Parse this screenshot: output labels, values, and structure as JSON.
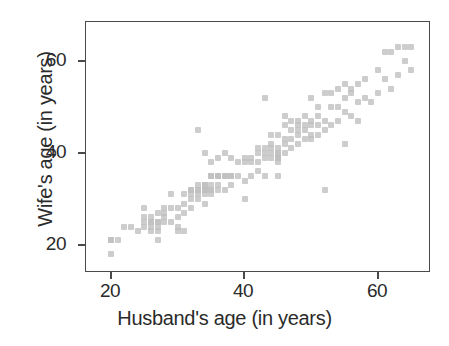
{
  "chart_data": {
    "type": "scatter",
    "title": "",
    "xlabel": "Husband's age (in years)",
    "ylabel": "Wife's age (in years)",
    "xlim": [
      17,
      68
    ],
    "ylim": [
      15,
      66
    ],
    "xticks": [
      20,
      40,
      60
    ],
    "yticks": [
      20,
      40,
      60
    ],
    "xtick_labels": [
      "20",
      "40",
      "60"
    ],
    "ytick_labels": [
      "20",
      "40",
      "60"
    ],
    "grid": false,
    "legend": null,
    "marker": {
      "shape": "square-round",
      "color": "#bfbfbf",
      "size_px": 6,
      "opacity": 0.78
    },
    "n_points": 170,
    "series": [
      {
        "name": "couples",
        "x": [
          20,
          20,
          20,
          21,
          22,
          23,
          24,
          25,
          25,
          25,
          25,
          26,
          26,
          26,
          26,
          26,
          27,
          27,
          27,
          27,
          27,
          27,
          28,
          28,
          28,
          28,
          29,
          29,
          29,
          30,
          30,
          30,
          30,
          31,
          31,
          31,
          31,
          32,
          32,
          32,
          32,
          32,
          33,
          33,
          33,
          33,
          33,
          33,
          34,
          34,
          34,
          34,
          34,
          34,
          34,
          34,
          35,
          35,
          35,
          35,
          35,
          35,
          35,
          36,
          36,
          36,
          36,
          36,
          36,
          37,
          37,
          37,
          37,
          38,
          38,
          38,
          38,
          39,
          39,
          40,
          40,
          40,
          40,
          41,
          41,
          41,
          42,
          42,
          42,
          42,
          43,
          43,
          43,
          43,
          43,
          44,
          44,
          44,
          44,
          44,
          45,
          45,
          45,
          45,
          45,
          45,
          45,
          45,
          45,
          46,
          46,
          46,
          46,
          46,
          47,
          47,
          47,
          47,
          48,
          48,
          48,
          48,
          48,
          49,
          49,
          49,
          49,
          50,
          50,
          50,
          50,
          50,
          51,
          51,
          51,
          51,
          52,
          52,
          52,
          52,
          53,
          53,
          53,
          54,
          54,
          54,
          55,
          55,
          55,
          55,
          56,
          56,
          56,
          57,
          57,
          57,
          58,
          58,
          59,
          60,
          60,
          61,
          61,
          62,
          62,
          63,
          63,
          64,
          64,
          65,
          65
        ],
        "y": [
          21,
          21,
          18,
          21,
          24,
          24,
          23,
          24,
          25,
          26,
          28,
          23,
          24,
          25,
          25,
          26,
          21,
          23,
          24,
          25,
          25,
          27,
          25,
          26,
          27,
          28,
          25,
          28,
          31,
          23,
          24,
          26,
          28,
          23,
          27,
          29,
          31,
          28,
          30,
          31,
          32,
          32,
          30,
          31,
          32,
          32,
          33,
          45,
          29,
          31,
          32,
          32,
          32,
          33,
          33,
          40,
          31,
          32,
          32,
          33,
          35,
          35,
          38,
          32,
          33,
          35,
          35,
          35,
          39,
          32,
          35,
          35,
          40,
          33,
          35,
          35,
          39,
          35,
          38,
          30,
          34,
          38,
          39,
          35,
          38,
          39,
          36,
          38,
          40,
          41,
          35,
          39,
          40,
          41,
          52,
          39,
          40,
          41,
          42,
          44,
          35,
          38,
          39,
          39,
          39,
          40,
          40,
          41,
          44,
          40,
          42,
          43,
          46,
          48,
          41,
          43,
          45,
          47,
          42,
          44,
          45,
          46,
          47,
          43,
          45,
          46,
          48,
          43,
          44,
          46,
          47,
          52,
          44,
          46,
          48,
          50,
          32,
          45,
          47,
          53,
          46,
          50,
          53,
          47,
          50,
          54,
          42,
          49,
          52,
          55,
          48,
          53,
          54,
          47,
          51,
          55,
          52,
          56,
          51,
          53,
          58,
          56,
          62,
          54,
          62,
          57,
          63,
          60,
          63,
          58,
          63
        ]
      }
    ]
  },
  "axes": {
    "x_label": "Husband's age (in years)",
    "y_label": "Wife's age (in years)",
    "x_ticks": [
      "20",
      "40",
      "60"
    ],
    "y_ticks": [
      "60",
      "40",
      "20"
    ]
  },
  "colors": {
    "marker": "#bfbfbf",
    "axis": "#4a4a4a",
    "text": "#2b2b2b",
    "background": "#ffffff"
  }
}
